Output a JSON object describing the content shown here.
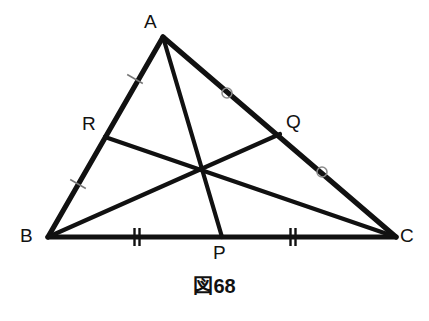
{
  "figure": {
    "caption": "図68",
    "background_color": "#ffffff",
    "stroke_color": "#111111",
    "tick_color": "#777777",
    "circle_mark_color": "#8a8a8a",
    "label_color": "#121212"
  },
  "vertices": [
    {
      "id": "A",
      "label": "A",
      "x": 163,
      "y": 37,
      "label_x": 144,
      "label_y": 12
    },
    {
      "id": "B",
      "label": "B",
      "x": 48,
      "y": 237,
      "label_x": 20,
      "label_y": 226
    },
    {
      "id": "C",
      "label": "C",
      "x": 396,
      "y": 237,
      "label_x": 400,
      "label_y": 226
    }
  ],
  "midpoints": [
    {
      "id": "P",
      "label": "P",
      "on_side": "BC",
      "x": 222,
      "y": 237,
      "label_x": 213,
      "label_y": 243
    },
    {
      "id": "Q",
      "label": "Q",
      "on_side": "AC",
      "x": 280,
      "y": 134,
      "label_x": 286,
      "label_y": 112
    },
    {
      "id": "R",
      "label": "R",
      "on_side": "AB",
      "x": 105,
      "y": 137,
      "label_x": 82,
      "label_y": 114
    }
  ],
  "centroid": {
    "id": "G",
    "x": 200,
    "y": 165
  },
  "sides": [
    {
      "name": "AB",
      "from": "A",
      "to": "B"
    },
    {
      "name": "BC",
      "from": "B",
      "to": "C"
    },
    {
      "name": "CA",
      "from": "C",
      "to": "A"
    }
  ],
  "medians": [
    {
      "name": "AP",
      "from": "A",
      "to": "P"
    },
    {
      "name": "BQ",
      "from": "B",
      "to": "Q"
    },
    {
      "name": "CR",
      "from": "C",
      "to": "R"
    }
  ],
  "tick_marks": [
    {
      "segment": "AR",
      "count": 1,
      "x": 135,
      "y": 79,
      "angle": -60,
      "style": "slash"
    },
    {
      "segment": "RB",
      "count": 1,
      "x": 78,
      "y": 184,
      "angle": -60,
      "style": "slash"
    },
    {
      "segment": "BP",
      "count": 2,
      "x": 137,
      "y": 237,
      "angle": 0,
      "style": "double-bar"
    },
    {
      "segment": "PC",
      "count": 2,
      "x": 293,
      "y": 237,
      "angle": 0,
      "style": "double-bar"
    }
  ],
  "circle_marks": [
    {
      "segment": "AQ",
      "x": 227,
      "y": 93,
      "r": 5
    },
    {
      "segment": "QC",
      "x": 322,
      "y": 172,
      "r": 5
    }
  ],
  "caption_position": {
    "y": 276
  },
  "chart_data": {
    "type": "diagram",
    "title": "図68",
    "points": {
      "A": [
        163,
        37
      ],
      "B": [
        48,
        237
      ],
      "C": [
        396,
        237
      ],
      "P": [
        222,
        237
      ],
      "Q": [
        280,
        134
      ],
      "R": [
        105,
        137
      ],
      "G": [
        200,
        165
      ]
    },
    "congruence_marks": {
      "single_slash": [
        "AR",
        "RB"
      ],
      "double_bar": [
        "BP",
        "PC"
      ],
      "open_circle": [
        "AQ",
        "QC"
      ]
    }
  }
}
